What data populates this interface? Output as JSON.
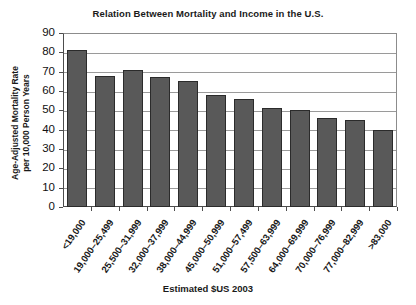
{
  "chart_data": {
    "type": "bar",
    "title": "Relation Between Mortality and Income in the U.S.",
    "xlabel": "Estimated $US 2003",
    "ylabel": "Age-Adjusted Mortality Rate per 10,000 Person Years",
    "ylabel_line1": "Age-Adjusted Mortality Rate",
    "ylabel_line2": "per 10,000 Person Years",
    "ylim": [
      0,
      90
    ],
    "ytick_step": 10,
    "yticks": [
      90,
      80,
      70,
      60,
      50,
      40,
      30,
      20,
      10,
      0
    ],
    "grid": true,
    "grid_axis": "y",
    "legend": "none",
    "bar_color": "#595959",
    "bar_edge_color": "#2b2b2b",
    "plot_border_color": "#8c8c8c",
    "gridline_color": "#9a9a9a",
    "categories": [
      "<19,000",
      "19,000–25,499",
      "25,500–31,999",
      "32,000–37,999",
      "38,000–44,999",
      "45,000–50,999",
      "51,000–57,499",
      "57,500–63,999",
      "64,000–69,999",
      "70,000–76,999",
      "77,000–82,999",
      ">83,000"
    ],
    "values": [
      81,
      68,
      71,
      67,
      65,
      58,
      56,
      51,
      50,
      46,
      45,
      40
    ]
  }
}
